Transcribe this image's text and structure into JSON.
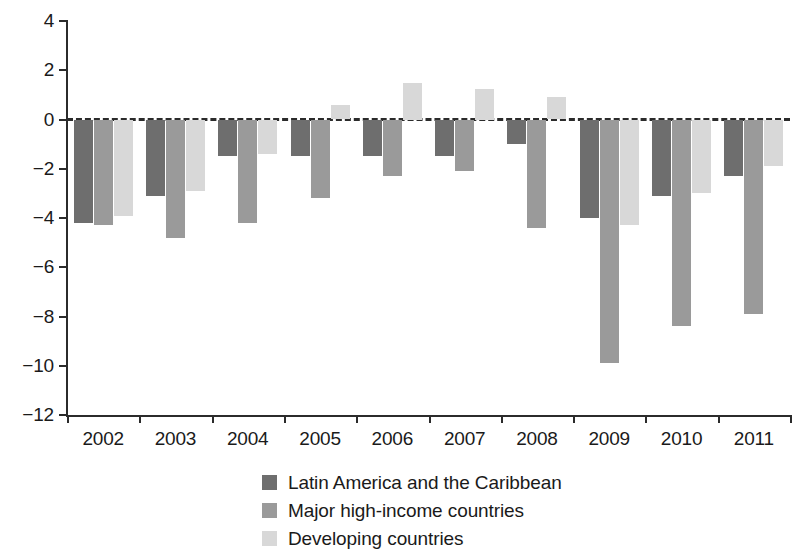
{
  "chart_data": {
    "type": "bar",
    "title": "",
    "subtitle": "",
    "xlabel": "",
    "ylabel": "",
    "categories": [
      "2002",
      "2003",
      "2004",
      "2005",
      "2006",
      "2007",
      "2008",
      "2009",
      "2010",
      "2011"
    ],
    "series": [
      {
        "name": "Latin America and the Caribbean",
        "color": "#6e6e6e",
        "values": [
          -4.2,
          -3.1,
          -1.5,
          -1.5,
          -1.5,
          -1.5,
          -1.0,
          -4.0,
          -3.1,
          -2.3
        ]
      },
      {
        "name": "Major high-income countries",
        "color": "#9a9a9a",
        "values": [
          -4.3,
          -4.8,
          -4.2,
          -3.2,
          -2.3,
          -2.1,
          -4.4,
          -9.9,
          -8.4,
          -7.9
        ]
      },
      {
        "name": "Developing countries",
        "color": "#d8d8d8",
        "values": [
          -3.9,
          -2.9,
          -1.4,
          0.6,
          1.5,
          1.25,
          0.9,
          -4.3,
          -3.0,
          -1.9
        ]
      }
    ],
    "ylim": [
      -12,
      4
    ],
    "y_ticks": [
      4,
      2,
      0,
      -2,
      -4,
      -6,
      -8,
      -10,
      -12
    ],
    "y_tick_labels": [
      "4",
      "2",
      "0",
      "-2",
      "-4",
      "-6",
      "-8",
      "-10",
      "-12"
    ],
    "grid": false,
    "zero_line": true,
    "zero_line_style": "dashed",
    "legend_position": "bottom",
    "legend": [
      "Latin America and the Caribbean",
      "Major high-income countries",
      "Developing countries"
    ]
  },
  "axis": {
    "tick_color": "#2b2b2b",
    "axis_color": "#2b2b2b"
  }
}
